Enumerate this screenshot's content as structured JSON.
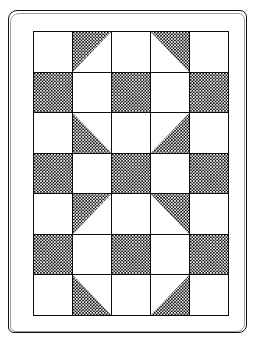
{
  "illustration": {
    "subject": "patchwork-quilt",
    "title": "",
    "caption": "",
    "background_color": "#ffffff",
    "ink_color": "#111111"
  },
  "frame": {
    "name": "quilt-border-frame",
    "style": "hand-drawn-double-outline",
    "stroke_color": "#111111"
  },
  "quilt": {
    "columns": 5,
    "rows": 7,
    "seam_color": "#0d0d0d",
    "light_fabric_color": "#ffffff",
    "dark_fabric_color": "#121212",
    "dark_fabric_texture": "fine-checkerboard-calico",
    "patch_types": {
      "light": "plain light square",
      "dark": "plain dark square",
      "hst-tl": "half-square triangle, dark on top-left",
      "hst-tr": "half-square triangle, dark on top-right",
      "hst-bl": "half-square triangle, dark on bottom-left",
      "hst-br": "half-square triangle, dark on bottom-right"
    },
    "grid": [
      [
        "light",
        "hst-tl",
        "light",
        "hst-tr",
        "light"
      ],
      [
        "dark",
        "light",
        "dark",
        "light",
        "dark"
      ],
      [
        "light",
        "hst-bl",
        "light",
        "hst-br",
        "light"
      ],
      [
        "dark",
        "light",
        "dark",
        "light",
        "dark"
      ],
      [
        "light",
        "hst-tl",
        "light",
        "hst-tr",
        "light"
      ],
      [
        "dark",
        "light",
        "dark",
        "light",
        "dark"
      ],
      [
        "light",
        "hst-bl",
        "light",
        "hst-br",
        "light"
      ]
    ]
  }
}
